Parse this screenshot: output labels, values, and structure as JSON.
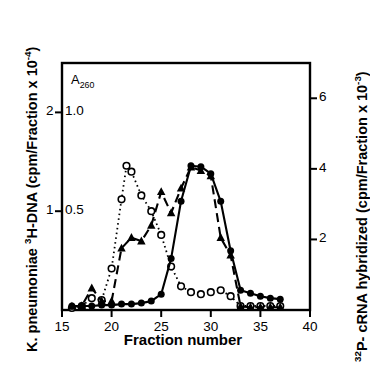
{
  "figure": {
    "xlabel": "Fraction number",
    "ylabel_left_prefix": "K. pneumoniae ",
    "ylabel_left_sup": "3",
    "ylabel_left_mid": "H-DNA (cpm/Fraction x 10",
    "ylabel_left_exp": "-4",
    "ylabel_left_end": ")",
    "ylabel_right_sup": "32",
    "ylabel_right_mid": "P- cRNA hybridized (cpm/Fraction x 10",
    "ylabel_right_exp": "-3",
    "ylabel_right_end": ")",
    "a260_label": "A",
    "a260_sub": "260",
    "axis_color": "#000000",
    "series_color": "#000000"
  },
  "axes": {
    "x_ticks": [
      "15",
      "20",
      "25",
      "30",
      "35",
      "40"
    ],
    "y_left_outer_ticks": [
      "2",
      "1"
    ],
    "y_left_inner_ticks": [
      "1.0",
      "0.5"
    ],
    "y_right_ticks": [
      "6",
      "4",
      "2"
    ]
  },
  "chart_data": {
    "type": "line",
    "title": "",
    "xlabel": "Fraction number",
    "ylabel": "K. pneumoniae 3H-DNA (cpm/Fraction x 10-4)",
    "ylabel_right": "32P- cRNA hybridized (cpm/Fraction x 10-3)",
    "xlim": [
      15,
      40
    ],
    "ylim_left_A260": [
      0,
      1.25
    ],
    "ylim_left_3HDNA": [
      0,
      2.5
    ],
    "ylim_right_32P": [
      0,
      7.0
    ],
    "grid": false,
    "legend": "none",
    "series": [
      {
        "name": "A260 absorbance",
        "marker": "open-circle",
        "line": "dotted",
        "axis": "left-A260",
        "x": [
          16,
          17,
          18,
          19,
          20,
          21,
          21.5,
          22,
          23,
          24,
          25,
          26,
          27,
          28,
          29,
          30,
          31,
          32,
          33,
          34,
          35,
          36,
          37
        ],
        "values": [
          0.01,
          0.02,
          0.06,
          0.05,
          0.21,
          0.56,
          0.73,
          0.7,
          0.58,
          0.5,
          0.38,
          0.22,
          0.12,
          0.09,
          0.08,
          0.09,
          0.1,
          0.07,
          0.02,
          0.02,
          0.02,
          0.02,
          0.02
        ]
      },
      {
        "name": "K. pneumoniae 3H-DNA",
        "marker": "filled-circle",
        "line": "solid",
        "axis": "left-3HDNA",
        "x": [
          16,
          17,
          18,
          19,
          20,
          21,
          22,
          23,
          24,
          25,
          26,
          27,
          28,
          29,
          30,
          31,
          32,
          33,
          34,
          35,
          36,
          37
        ],
        "values": [
          0.04,
          0.04,
          0.04,
          0.05,
          0.05,
          0.06,
          0.06,
          0.07,
          0.09,
          0.16,
          0.52,
          1.1,
          1.46,
          1.45,
          1.38,
          1.1,
          0.6,
          0.2,
          0.17,
          0.14,
          0.12,
          0.11
        ]
      },
      {
        "name": "32P- cRNA hybridized",
        "marker": "filled-triangle",
        "line": "dashed",
        "axis": "right-32P",
        "x": [
          16,
          17,
          18,
          19,
          20,
          21,
          22,
          23,
          24,
          25,
          26,
          27,
          28,
          29,
          30,
          31,
          32,
          33,
          34,
          35,
          36,
          37
        ],
        "values": [
          0.1,
          0.12,
          0.62,
          0.25,
          0.25,
          1.75,
          2.05,
          1.95,
          2.4,
          3.35,
          2.75,
          3.45,
          4.05,
          3.95,
          3.8,
          2.05,
          1.55,
          0.1,
          0.08,
          0.08,
          0.08,
          0.08
        ]
      }
    ]
  }
}
